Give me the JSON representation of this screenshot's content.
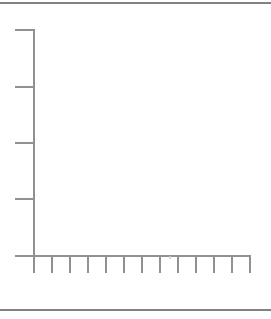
{
  "chart_data": {
    "type": "line",
    "title": "",
    "xlabel": "",
    "ylabel": "",
    "categories": [],
    "series": [],
    "plot_content": "empty axes — no data points, bars, labels, or tick text plotted",
    "grid": false,
    "legend": false,
    "x_axis": {
      "tick_labels": [],
      "num_ticks": 12,
      "tick_positions_px": [
        51,
        69,
        87,
        105,
        123,
        141,
        159,
        177,
        195,
        213,
        231,
        249
      ],
      "axis_y_px": 255,
      "axis_start_x_px": 15,
      "axis_end_x_px": 250,
      "tick_length_px": 18
    },
    "y_axis": {
      "tick_labels": [],
      "num_ticks": 4,
      "tick_positions_px": [
        29,
        86,
        142,
        198
      ],
      "axis_x_px": 33,
      "axis_start_y_px": 29,
      "axis_end_y_px": 273,
      "tick_start_x_px": 15,
      "tick_length_px": 19.5
    }
  },
  "page": {
    "width_px": 271,
    "height_px": 319,
    "top_rule_y_px": 2,
    "bottom_rule_y_px": 309
  },
  "artifacts": {
    "faint_speck": {
      "x_px": 169,
      "y_px": 256
    }
  },
  "colors": {
    "background": "#ffffff",
    "axis_line": "#8f9193",
    "rule_line": "#7f8285",
    "speck": "#cccccc"
  }
}
